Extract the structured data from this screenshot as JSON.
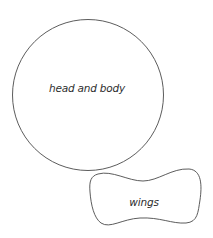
{
  "diagram": {
    "shapes": [
      {
        "id": "head-and-body",
        "kind": "circle",
        "label": "head and body",
        "cx": 88,
        "cy": 95,
        "r": 75,
        "label_x": 87,
        "label_y": 88
      },
      {
        "id": "wings",
        "kind": "blob",
        "label": "wings",
        "label_x": 144,
        "label_y": 202
      }
    ],
    "stroke_color": "#4a4a4a",
    "text_color": "#2e2e2e",
    "background": "#ffffff"
  }
}
